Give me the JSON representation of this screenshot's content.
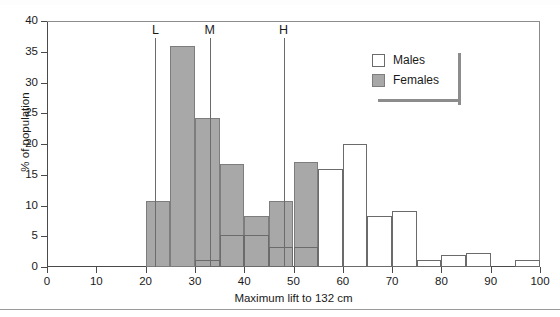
{
  "chart_data": {
    "type": "bar",
    "title": "",
    "subtitle": "",
    "xlabel": "Maximum lift to 132 cm",
    "ylabel": "% of population",
    "xlim": [
      0,
      100
    ],
    "ylim": [
      0,
      40
    ],
    "grid": false,
    "legend_position": "top-right",
    "bin_width": 5,
    "x_ticks": [
      0,
      10,
      20,
      30,
      40,
      50,
      60,
      70,
      80,
      90,
      100
    ],
    "y_ticks": [
      0,
      5,
      10,
      15,
      20,
      25,
      30,
      35,
      40
    ],
    "bin_starts": [
      0,
      5,
      10,
      15,
      20,
      25,
      30,
      35,
      40,
      45,
      50,
      55,
      60,
      65,
      70,
      75,
      80,
      85,
      90,
      95
    ],
    "series": [
      {
        "name": "Males",
        "style": "outline",
        "color": "#ffffff",
        "edge_color": "#6b6b6b",
        "values": [
          0,
          0,
          0,
          0,
          0,
          0,
          1.2,
          5.2,
          5.2,
          3.3,
          3.3,
          16.0,
          20.0,
          8.3,
          9.1,
          1.1,
          2.0,
          2.3,
          0,
          1.1
        ]
      },
      {
        "name": "Females",
        "style": "filled",
        "color": "#a8a8a8",
        "edge_color": "#7d7d7d",
        "values": [
          0,
          0,
          0,
          0,
          10.7,
          36.0,
          24.2,
          16.8,
          8.3,
          10.7,
          17.0,
          0,
          0,
          0,
          0,
          0,
          0,
          0,
          0,
          0
        ]
      }
    ],
    "reference_lines": [
      {
        "label": "L",
        "x": 22.0
      },
      {
        "label": "M",
        "x": 33.0
      },
      {
        "label": "H",
        "x": 48.0
      }
    ]
  },
  "legend": {
    "items": [
      {
        "label": "Males",
        "swatch": "open-square"
      },
      {
        "label": "Females",
        "swatch": "filled-square"
      }
    ]
  },
  "colors": {
    "female_fill": "#a8a8a8",
    "female_edge": "#7d7d7d",
    "male_edge": "#6b6b6b",
    "axis": "#4a4a4a",
    "frame": "#8c8c8c"
  }
}
